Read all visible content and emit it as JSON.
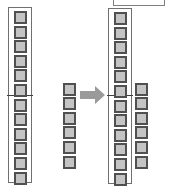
{
  "diagram": {
    "left": {
      "tall_stack": {
        "blocks": 12,
        "framed": true,
        "divider_after_block": 6
      },
      "short_stack": {
        "blocks": 6,
        "framed": false
      }
    },
    "arrow": {
      "direction": "right",
      "color": "#9a9a9a"
    },
    "right": {
      "top_box": {
        "visible": true,
        "partially_cropped": true
      },
      "tall_stack": {
        "blocks": 12,
        "framed": true,
        "divider_after_block": 6
      },
      "short_stack": {
        "blocks": 6,
        "framed": false
      }
    },
    "colors": {
      "block_fill": "#c4c4c4",
      "block_border": "#505050",
      "frame_border": "#707070",
      "background": "#ffffff"
    }
  }
}
